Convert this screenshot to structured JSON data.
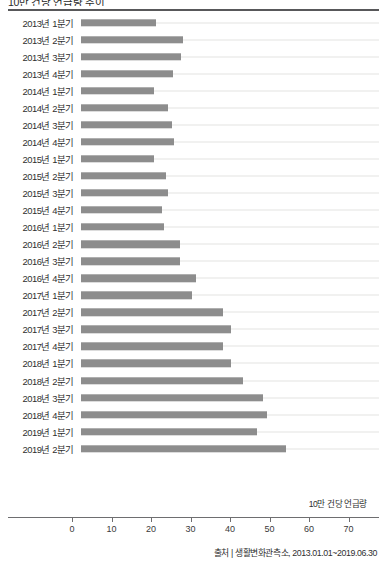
{
  "header": {
    "title_partial": "10만 건당 언급량 추이",
    "divider": "title-rule"
  },
  "source_note": "출처 | 생활변화관측소, 2013.01.01~2019.06.30",
  "colors": {
    "bar": "#8d8d8d",
    "axis": "#6e6e70",
    "gridline": "#e3e3e1",
    "text": "#2f2f2f"
  },
  "chart_data": {
    "type": "bar",
    "orientation": "horizontal",
    "title": "10만 건당 언급량 추이",
    "xlabel": "10만 건당 언급량",
    "ylabel": "",
    "xlim": [
      0,
      75
    ],
    "xticks": [
      0,
      10,
      20,
      30,
      40,
      50,
      60,
      70
    ],
    "grid": true,
    "legend": null,
    "categories": [
      "2013년 1분기",
      "2013년 2분기",
      "2013년 3분기",
      "2013년 4분기",
      "2014년 1분기",
      "2014년 2분기",
      "2014년 3분기",
      "2014년 4분기",
      "2015년 1분기",
      "2015년 2분기",
      "2015년 3분기",
      "2015년 4분기",
      "2016년 1분기",
      "2016년 2분기",
      "2016년 3분기",
      "2016년 4분기",
      "2017년 1분기",
      "2017년 2분기",
      "2017년 3분기",
      "2017년 4분기",
      "2018년 1분기",
      "2018년 2분기",
      "2018년 3분기",
      "2018년 4분기",
      "2019년 1분기",
      "2019년 2분기"
    ],
    "values": [
      19.0,
      25.8,
      25.3,
      23.3,
      18.5,
      22.0,
      23.0,
      23.5,
      18.5,
      21.5,
      22.0,
      20.5,
      21.0,
      25.0,
      25.0,
      29.0,
      28.0,
      36.0,
      38.0,
      36.0,
      38.0,
      41.0,
      46.0,
      47.0,
      44.5,
      52.0
    ]
  }
}
